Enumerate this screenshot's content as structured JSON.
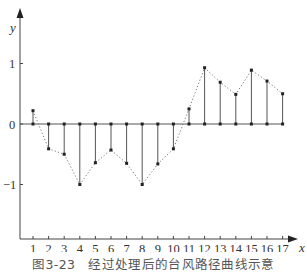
{
  "caption": "图3-23　经过处理后的台风路径曲线示意",
  "chart_data": {
    "type": "stem-line",
    "xlabel": "x",
    "ylabel": "y",
    "x": [
      1,
      2,
      3,
      4,
      5,
      6,
      7,
      8,
      9,
      10,
      11,
      12,
      13,
      14,
      15,
      16,
      17
    ],
    "values": [
      0.22,
      -0.41,
      -0.5,
      -1.0,
      -0.64,
      -0.43,
      -0.65,
      -1.0,
      -0.66,
      -0.41,
      0.25,
      0.93,
      0.69,
      0.49,
      0.89,
      0.71,
      0.5
    ],
    "y_ticks": [
      1,
      0,
      -1
    ],
    "x_ticks": [
      1,
      2,
      3,
      4,
      5,
      6,
      7,
      8,
      9,
      10,
      11,
      12,
      13,
      14,
      15,
      16,
      17
    ],
    "xlim": [
      0,
      18
    ],
    "ylim": [
      -1.9,
      1.9
    ],
    "grid": false,
    "legend": null,
    "style": {
      "stem_color": "#555555",
      "envelope_line": "dotted",
      "envelope_color": "#777777",
      "baseline_color": "#555555",
      "axis_color": "#444444"
    }
  }
}
